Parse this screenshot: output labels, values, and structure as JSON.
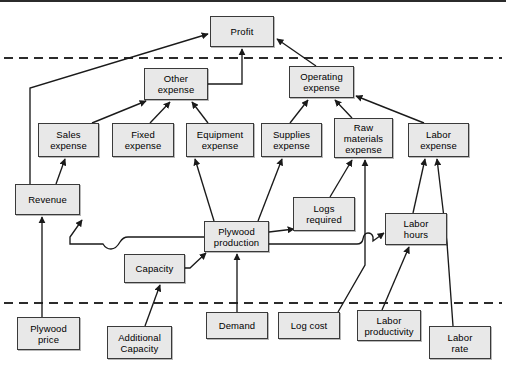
{
  "diagram": {
    "box_fill": "#e8e8e8",
    "box_border": "#3a3a3a",
    "line_color": "#1a1a1a",
    "dashed_color": "#2b2b2b",
    "nodes": [
      {
        "id": "profit",
        "label": "Profit",
        "x": 210,
        "y": 16,
        "w": 64,
        "h": 31
      },
      {
        "id": "other-expense",
        "label": "Other\nexpense",
        "x": 144,
        "y": 68,
        "w": 64,
        "h": 32
      },
      {
        "id": "operating-expense",
        "label": "Operating\nexpense",
        "x": 289,
        "y": 66,
        "w": 65,
        "h": 32
      },
      {
        "id": "sales-expense",
        "label": "Sales\nexpense",
        "x": 38,
        "y": 123,
        "w": 61,
        "h": 34
      },
      {
        "id": "fixed-expense",
        "label": "Fixed\nexpense",
        "x": 112,
        "y": 123,
        "w": 62,
        "h": 34
      },
      {
        "id": "equipment-expense",
        "label": "Equipment\nexpense",
        "x": 186,
        "y": 123,
        "w": 68,
        "h": 34
      },
      {
        "id": "supplies-expense",
        "label": "Supplies\nexpense",
        "x": 261,
        "y": 123,
        "w": 61,
        "h": 34
      },
      {
        "id": "raw-materials",
        "label": "Raw\nmaterials\nexpense",
        "x": 334,
        "y": 118,
        "w": 59,
        "h": 40
      },
      {
        "id": "labor-expense",
        "label": "Labor\nexpense",
        "x": 408,
        "y": 123,
        "w": 61,
        "h": 34
      },
      {
        "id": "revenue",
        "label": "Revenue",
        "x": 15,
        "y": 184,
        "w": 65,
        "h": 31
      },
      {
        "id": "logs-required",
        "label": "Logs\nrequired",
        "x": 293,
        "y": 197,
        "w": 62,
        "h": 34
      },
      {
        "id": "labor-hours",
        "label": "Labor\nhours",
        "x": 385,
        "y": 213,
        "w": 62,
        "h": 32
      },
      {
        "id": "plywood-production",
        "label": "Plywood\nproduction",
        "x": 204,
        "y": 221,
        "w": 65,
        "h": 31
      },
      {
        "id": "capacity",
        "label": "Capacity",
        "x": 124,
        "y": 254,
        "w": 61,
        "h": 29
      },
      {
        "id": "plywood-price",
        "label": "Plywood\nprice",
        "x": 17,
        "y": 317,
        "w": 63,
        "h": 33
      },
      {
        "id": "additional-capacity",
        "label": "Additional\nCapacity",
        "x": 107,
        "y": 326,
        "w": 65,
        "h": 33
      },
      {
        "id": "demand",
        "label": "Demand",
        "x": 206,
        "y": 312,
        "w": 62,
        "h": 27
      },
      {
        "id": "log-cost",
        "label": "Log cost",
        "x": 278,
        "y": 312,
        "w": 62,
        "h": 27
      },
      {
        "id": "labor-productivity",
        "label": "Labor\nproductivity",
        "x": 357,
        "y": 310,
        "w": 64,
        "h": 31
      },
      {
        "id": "labor-rate",
        "label": "Labor\nrate",
        "x": 429,
        "y": 326,
        "w": 62,
        "h": 33
      }
    ],
    "dashed_dividers": [
      {
        "y": 58,
        "x1": 4,
        "x2": 502
      },
      {
        "y": 303,
        "x1": 4,
        "x2": 502
      }
    ],
    "edges": [
      {
        "from": "revenue",
        "to": "profit"
      },
      {
        "from": "other-expense",
        "to": "profit"
      },
      {
        "from": "operating-expense",
        "to": "profit"
      },
      {
        "from": "sales-expense",
        "to": "other-expense"
      },
      {
        "from": "fixed-expense",
        "to": "other-expense"
      },
      {
        "from": "equipment-expense",
        "to": "other-expense"
      },
      {
        "from": "supplies-expense",
        "to": "operating-expense"
      },
      {
        "from": "raw-materials",
        "to": "operating-expense"
      },
      {
        "from": "labor-expense",
        "to": "operating-expense"
      },
      {
        "from": "revenue",
        "to": "sales-expense"
      },
      {
        "from": "plywood-price",
        "to": "revenue"
      },
      {
        "from": "plywood-production",
        "to": "revenue"
      },
      {
        "from": "plywood-production",
        "to": "equipment-expense"
      },
      {
        "from": "plywood-production",
        "to": "supplies-expense"
      },
      {
        "from": "plywood-production",
        "to": "logs-required"
      },
      {
        "from": "plywood-production",
        "to": "labor-hours"
      },
      {
        "from": "logs-required",
        "to": "raw-materials"
      },
      {
        "from": "log-cost",
        "to": "raw-materials"
      },
      {
        "from": "capacity",
        "to": "plywood-production"
      },
      {
        "from": "demand",
        "to": "plywood-production"
      },
      {
        "from": "additional-capacity",
        "to": "capacity"
      },
      {
        "from": "labor-productivity",
        "to": "labor-hours"
      },
      {
        "from": "labor-hours",
        "to": "labor-expense"
      },
      {
        "from": "labor-rate",
        "to": "labor-expense"
      }
    ]
  }
}
